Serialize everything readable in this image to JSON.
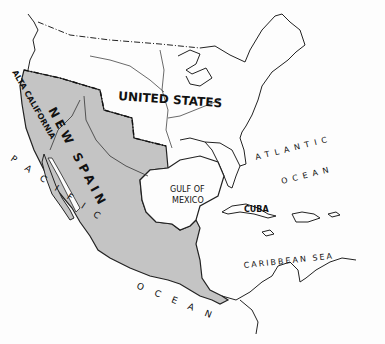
{
  "map": {
    "type": "historical outline map",
    "colors": {
      "land_highlight": "#c4c4c4",
      "outline": "#1a1a1a",
      "background": "#fdfdfd"
    },
    "labels": {
      "united_states": "UNITED STATES",
      "new_spain": "NEW SPAIN",
      "alta_california": "ALTA CALIFORNIA",
      "pacific": "PACIFIC",
      "pacific_ocean": "OCEAN",
      "atlantic": "ATLANTIC",
      "atlantic_ocean": "OCEAN",
      "gulf_line1": "GULF OF",
      "gulf_line2": "MEXICO",
      "cuba": "CUBA",
      "caribbean": "CARIBBEAN SEA"
    }
  }
}
